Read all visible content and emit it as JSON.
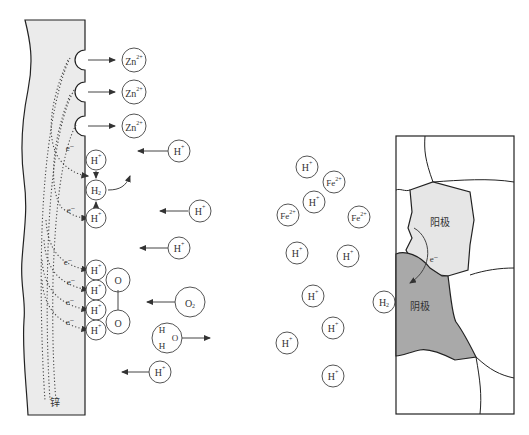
{
  "left_panel": {
    "electrode_label": "锌",
    "zinc_ions": [
      "Zn2+",
      "Zn2+",
      "Zn2+"
    ],
    "electron_label": "e⁻",
    "surface_ions": [
      "H+",
      "H2",
      "H+",
      "H+",
      "H+",
      "H+",
      "H+"
    ],
    "solution_ions": [
      "H+",
      "H+",
      "H+",
      "H+",
      "O2",
      "H+"
    ],
    "oxygen_atoms": [
      "O",
      "O"
    ],
    "water": {
      "h1": "H",
      "h2": "H",
      "o": "O"
    }
  },
  "middle_panel": {
    "ions": [
      "H+",
      "Fe2+",
      "H+",
      "Fe2+",
      "Fe2+",
      "H+",
      "H+",
      "H+",
      "H+",
      "H+",
      "H+",
      "H2"
    ]
  },
  "right_panel": {
    "anode_label": "阳极",
    "cathode_label": "阴极",
    "electron_label": "e⁻",
    "colors": {
      "anode": "#e6e6e6",
      "cathode": "#a9a9a9",
      "grain": "#ffffff"
    }
  }
}
